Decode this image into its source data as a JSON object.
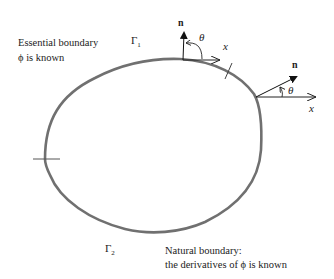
{
  "diagram": {
    "colors": {
      "boundary": "#707070",
      "ink": "#222222",
      "background": "#ffffff"
    },
    "labels": {
      "essential_line1": "Essential boundary",
      "essential_line2": "ϕ is known",
      "gamma1": "Γ",
      "gamma1_sub": "1",
      "gamma2": "Γ",
      "gamma2_sub": "2",
      "natural_line1": "Natural boundary:",
      "natural_line2": "the derivatives of ϕ is known"
    },
    "vectors": [
      {
        "name": "normal-top",
        "normal_label": "n",
        "angle_label": "θ",
        "axis_label": "x"
      },
      {
        "name": "normal-right",
        "normal_label": "n",
        "angle_label": "θ",
        "axis_label": "x"
      }
    ]
  }
}
